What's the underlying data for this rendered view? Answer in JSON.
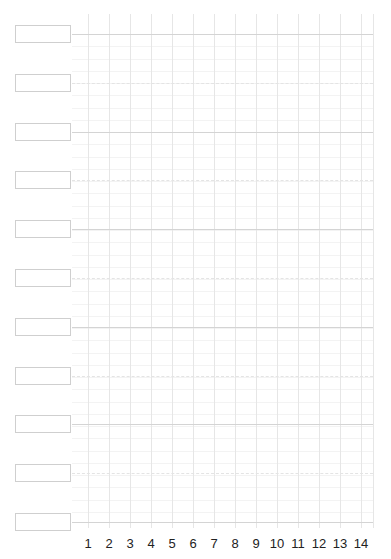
{
  "header": {
    "title_partial": ""
  },
  "grid": {
    "columns": [
      "1",
      "2",
      "3",
      "4",
      "5",
      "6",
      "7",
      "8",
      "9",
      "10",
      "11",
      "12",
      "13",
      "14"
    ],
    "rows": 11,
    "row_labels": [
      "",
      "",
      "",
      "",
      "",
      "",
      "",
      "",
      "",
      "",
      ""
    ]
  },
  "colors": {
    "solid_line": "#d4d4d4",
    "dashed_line": "#e4e4e4",
    "vertical_line": "#e6e6e6",
    "box_border": "#cfcfcf",
    "number_text": "#222222"
  }
}
